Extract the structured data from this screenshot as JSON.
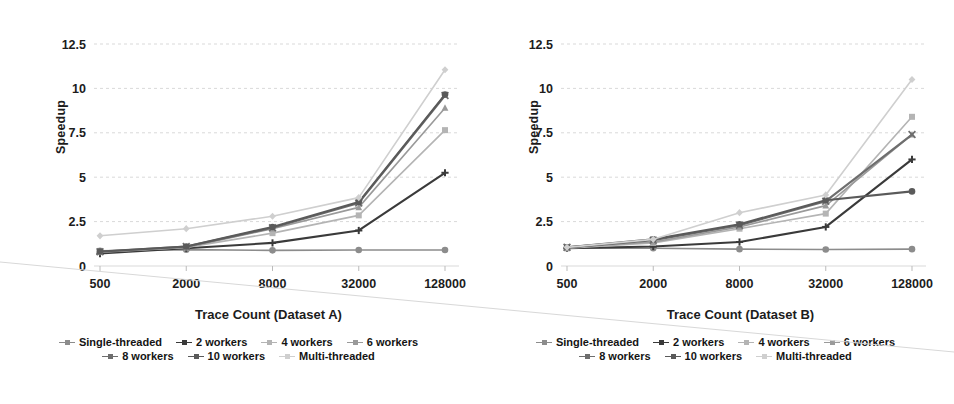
{
  "figure": {
    "background": "#ffffff",
    "scan_artifact": "page-fold-diagonal"
  },
  "chart_data": [
    {
      "type": "line",
      "panel": "A",
      "title": "",
      "xlabel": "Trace Count (Dataset A)",
      "ylabel": "Speedup",
      "categories": [
        "500",
        "2000",
        "8000",
        "32000",
        "128000"
      ],
      "yticks": [
        "0",
        "2.5",
        "5",
        "7.5",
        "10",
        "12.5"
      ],
      "ylim": [
        0,
        12.5
      ],
      "grid": true,
      "legend_position": "bottom",
      "series": [
        {
          "name": "Single-threaded",
          "values": [
            0.85,
            0.92,
            0.88,
            0.9,
            0.9
          ],
          "color": "#8c8c8c",
          "marker": "circle"
        },
        {
          "name": "2 workers",
          "values": [
            0.7,
            1.0,
            1.3,
            2.0,
            5.25
          ],
          "color": "#3a3a3a",
          "marker": "plus"
        },
        {
          "name": "4 workers",
          "values": [
            0.78,
            1.05,
            1.85,
            2.85,
            7.65
          ],
          "color": "#b4b4b4",
          "marker": "square"
        },
        {
          "name": "6 workers",
          "values": [
            0.8,
            1.05,
            2.1,
            3.3,
            8.9
          ],
          "color": "#9a9a9a",
          "marker": "triangle"
        },
        {
          "name": "8 workers",
          "values": [
            0.8,
            1.1,
            2.15,
            3.55,
            9.6
          ],
          "color": "#6e6e6e",
          "marker": "cross"
        },
        {
          "name": "10 workers",
          "values": [
            0.82,
            1.1,
            2.2,
            3.6,
            9.65
          ],
          "color": "#5a5a5a",
          "marker": "circle"
        },
        {
          "name": "Multi-threaded",
          "values": [
            1.7,
            2.1,
            2.8,
            3.85,
            11.05
          ],
          "color": "#cfcfcf",
          "marker": "diamond"
        }
      ]
    },
    {
      "type": "line",
      "panel": "B",
      "title": "",
      "xlabel": "Trace Count (Dataset B)",
      "ylabel": "Speedup",
      "categories": [
        "500",
        "2000",
        "8000",
        "32000",
        "128000"
      ],
      "yticks": [
        "0",
        "2.5",
        "5",
        "7.5",
        "10",
        "12.5"
      ],
      "ylim": [
        0,
        12.5
      ],
      "grid": true,
      "legend_position": "bottom",
      "series": [
        {
          "name": "Single-threaded",
          "values": [
            1.0,
            1.0,
            0.95,
            0.93,
            0.95
          ],
          "color": "#8c8c8c",
          "marker": "circle"
        },
        {
          "name": "2 workers",
          "values": [
            1.0,
            1.1,
            1.35,
            2.2,
            6.0
          ],
          "color": "#3a3a3a",
          "marker": "plus"
        },
        {
          "name": "4 workers",
          "values": [
            1.0,
            1.3,
            2.1,
            2.95,
            8.4
          ],
          "color": "#b4b4b4",
          "marker": "square"
        },
        {
          "name": "6 workers",
          "values": [
            1.05,
            1.35,
            2.2,
            3.4,
            7.4
          ],
          "color": "#9a9a9a",
          "marker": "triangle"
        },
        {
          "name": "8 workers",
          "values": [
            1.05,
            1.45,
            2.3,
            3.65,
            7.4
          ],
          "color": "#6e6e6e",
          "marker": "cross"
        },
        {
          "name": "10 workers",
          "values": [
            1.05,
            1.5,
            2.35,
            3.7,
            4.2
          ],
          "color": "#5a5a5a",
          "marker": "circle"
        },
        {
          "name": "Multi-threaded",
          "values": [
            1.05,
            1.5,
            3.0,
            4.0,
            10.5
          ],
          "color": "#cfcfcf",
          "marker": "diamond"
        }
      ]
    }
  ],
  "legend": {
    "row1": [
      {
        "label": "Single-threaded",
        "color": "#8c8c8c"
      },
      {
        "label": "2 workers",
        "color": "#3a3a3a"
      },
      {
        "label": "4 workers",
        "color": "#b4b4b4"
      },
      {
        "label": "6 workers",
        "color": "#9a9a9a"
      }
    ],
    "row2": [
      {
        "label": "8 workers",
        "color": "#6e6e6e"
      },
      {
        "label": "10 workers",
        "color": "#5a5a5a"
      },
      {
        "label": "Multi-threaded",
        "color": "#cfcfcf"
      }
    ]
  }
}
